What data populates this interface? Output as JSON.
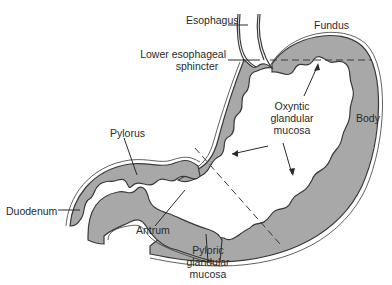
{
  "colors": {
    "mucosa": "#a8a8a8",
    "outline": "#3a3a3a",
    "background": "#ffffff",
    "text": "#2a2a2a"
  },
  "labels": {
    "esophagus": "Esophagus",
    "fundus": "Fundus",
    "les_line1": "Lower esophageal",
    "les_line2": "sphincter",
    "oxyntic_line1": "Oxyntic",
    "oxyntic_line2": "glandular",
    "oxyntic_line3": "mucosa",
    "body": "Body",
    "pylorus": "Pylorus",
    "duodenum": "Duodenum",
    "antrum": "Antrum",
    "pyloric_line1": "Pyloric",
    "pyloric_line2": "glandular",
    "pyloric_line3": "mucosa"
  }
}
